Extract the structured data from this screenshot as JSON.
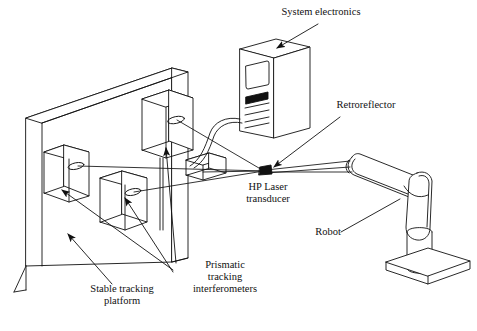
{
  "figure": {
    "type": "line-diagram",
    "background": "#ffffff",
    "stroke": "#111111"
  },
  "labels": {
    "system_electronics": "System electronics",
    "retroreflector": "Retroreflector",
    "hp_laser_line1": "HP Laser",
    "hp_laser_line2": "transducer",
    "robot": "Robot",
    "prismatic_line1": "Prismatic",
    "prismatic_line2": "tracking",
    "prismatic_line3": "interferometers",
    "stable_line1": "Stable tracking",
    "stable_line2": "platform"
  },
  "components": {
    "system_electronics_tower": "computer-tower",
    "stable_tracking_platform": "wall-slab",
    "interferometers": [
      {
        "name": "interferometer-upper-right"
      },
      {
        "name": "interferometer-left"
      },
      {
        "name": "interferometer-center"
      },
      {
        "name": "interferometer-side-block"
      }
    ],
    "retroreflector_marker": "retroreflector-target",
    "robot_arm": "articulated-robot-arm",
    "robot_base": "robot-base-plate",
    "signal_cable": "tower-to-platform-cable"
  },
  "beams": {
    "count": 4,
    "description": "laser beams converging at retroreflector"
  }
}
